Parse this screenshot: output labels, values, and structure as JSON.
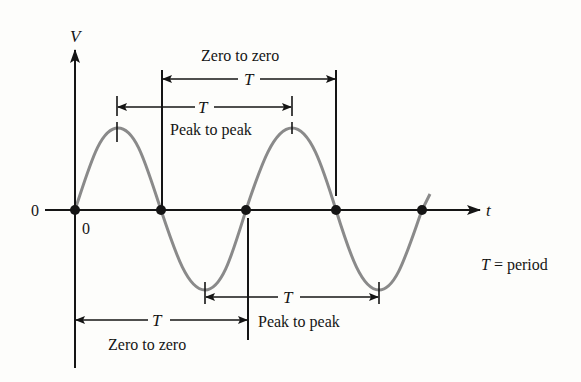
{
  "diagram": {
    "axes": {
      "y_label": "V",
      "x_label": "t",
      "y_origin_label": "0",
      "x_origin_label": "0"
    },
    "annotations": {
      "top_zero_to_zero": {
        "symbol": "T",
        "label": "Zero to zero"
      },
      "top_peak_to_peak": {
        "symbol": "T",
        "label": "Peak to peak"
      },
      "bottom_peak_to_peak": {
        "symbol": "T",
        "label": "Peak to peak"
      },
      "bottom_zero_to_zero": {
        "symbol": "T",
        "label": "Zero to zero"
      }
    },
    "legend": {
      "symbol": "T",
      "text": " = period"
    },
    "colors": {
      "wave": "#8a8a8a",
      "ink": "#151515",
      "background": "#fdfdfb"
    },
    "zero_crossings_px": [
      75,
      161,
      246,
      336,
      422
    ],
    "peaks_px": [
      118,
      292
    ],
    "troughs_px": [
      205,
      379
    ]
  }
}
